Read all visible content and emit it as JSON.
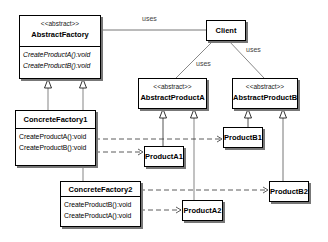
{
  "diagram": {
    "type": "UML class diagram",
    "classes": {
      "abstract_factory": {
        "stereotype": "<<abstract>>",
        "name": "AbstractFactory",
        "operations": [
          "CreateProductA():void",
          "CreateProductB():void"
        ]
      },
      "client": {
        "name": "Client"
      },
      "abstract_product_a": {
        "stereotype": "<<abstract>>",
        "name": "AbstractProductA"
      },
      "abstract_product_b": {
        "stereotype": "<<abstract>>",
        "name": "AbstractProductB"
      },
      "concrete_factory_1": {
        "name": "ConcreteFactory1",
        "operations": [
          "CreateProductA():void",
          "CreateProductB():void"
        ]
      },
      "concrete_factory_2": {
        "name": "ConcreteFactory2",
        "operations": [
          "CreateProductB():void",
          "CreateProductA():void"
        ]
      },
      "product_a1": {
        "name": "ProductA1"
      },
      "product_b1": {
        "name": "ProductB1"
      },
      "product_a2": {
        "name": "ProductA2"
      },
      "product_b2": {
        "name": "ProductB2"
      }
    },
    "associations": {
      "client_factory": "uses",
      "client_product_a": "uses",
      "client_product_b": "uses"
    },
    "relationships": [
      {
        "from": "Client",
        "to": "AbstractFactory",
        "kind": "association",
        "label": "uses"
      },
      {
        "from": "Client",
        "to": "AbstractProductA",
        "kind": "association",
        "label": "uses"
      },
      {
        "from": "Client",
        "to": "AbstractProductB",
        "kind": "association",
        "label": "uses"
      },
      {
        "from": "ConcreteFactory1",
        "to": "AbstractFactory",
        "kind": "generalization"
      },
      {
        "from": "ConcreteFactory2",
        "to": "AbstractFactory",
        "kind": "generalization"
      },
      {
        "from": "ProductA1",
        "to": "AbstractProductA",
        "kind": "generalization"
      },
      {
        "from": "ProductA2",
        "to": "AbstractProductA",
        "kind": "generalization"
      },
      {
        "from": "ProductB1",
        "to": "AbstractProductB",
        "kind": "generalization"
      },
      {
        "from": "ProductB2",
        "to": "AbstractProductB",
        "kind": "generalization"
      },
      {
        "from": "ConcreteFactory1",
        "to": "ProductA1",
        "kind": "dependency"
      },
      {
        "from": "ConcreteFactory1",
        "to": "ProductB1",
        "kind": "dependency"
      },
      {
        "from": "ConcreteFactory2",
        "to": "ProductB2",
        "kind": "dependency"
      },
      {
        "from": "ConcreteFactory2",
        "to": "ProductA2",
        "kind": "dependency"
      }
    ]
  }
}
